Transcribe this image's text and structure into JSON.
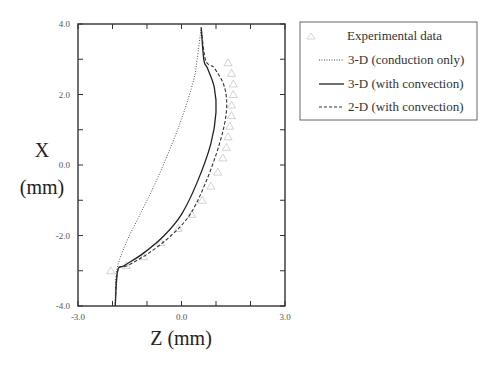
{
  "chart_data": {
    "type": "line",
    "title": "",
    "xlabel": "Z (mm)",
    "ylabel_line1": "X",
    "ylabel_line2": "(mm)",
    "xlim": [
      -3.0,
      3.0
    ],
    "ylim": [
      -4.0,
      4.0
    ],
    "x_tick_labels": [
      "-3.0",
      "0.0",
      "3.0"
    ],
    "y_tick_labels": [
      "4.0",
      "2.0",
      "0.0",
      "-2.0",
      "-4.0"
    ],
    "grid": false,
    "legend_position": "upper-right-outside",
    "series": [
      {
        "name": "Experimental data",
        "style": "triangle-markers",
        "points": [
          [
            1.35,
            2.9
          ],
          [
            1.45,
            2.6
          ],
          [
            1.5,
            2.3
          ],
          [
            1.5,
            2.0
          ],
          [
            1.45,
            1.7
          ],
          [
            1.45,
            1.4
          ],
          [
            1.4,
            1.1
          ],
          [
            1.35,
            0.8
          ],
          [
            1.3,
            0.5
          ],
          [
            1.2,
            0.2
          ],
          [
            1.05,
            -0.2
          ],
          [
            0.85,
            -0.6
          ],
          [
            0.6,
            -1.0
          ],
          [
            0.3,
            -1.4
          ],
          [
            -0.1,
            -1.8
          ],
          [
            -0.6,
            -2.2
          ],
          [
            -1.1,
            -2.6
          ],
          [
            -1.6,
            -2.85
          ],
          [
            -2.05,
            -3.0
          ]
        ]
      },
      {
        "name": "3-D (conduction only)",
        "style": "dotted",
        "points": [
          [
            -1.92,
            -4.0
          ],
          [
            -1.88,
            -3.0
          ],
          [
            -1.6,
            -2.2
          ],
          [
            -1.2,
            -1.4
          ],
          [
            -0.8,
            -0.6
          ],
          [
            -0.4,
            0.3
          ],
          [
            0.0,
            1.3
          ],
          [
            0.35,
            2.4
          ],
          [
            0.45,
            2.97
          ],
          [
            0.57,
            3.9
          ]
        ]
      },
      {
        "name": "3-D (with convection)",
        "style": "solid",
        "points": [
          [
            -1.92,
            -4.0
          ],
          [
            -1.85,
            -3.0
          ],
          [
            -1.65,
            -2.85
          ],
          [
            -1.1,
            -2.5
          ],
          [
            -0.5,
            -2.0
          ],
          [
            0.0,
            -1.4
          ],
          [
            0.45,
            -0.5
          ],
          [
            0.85,
            0.6
          ],
          [
            1.0,
            1.5
          ],
          [
            0.95,
            2.2
          ],
          [
            0.75,
            2.75
          ],
          [
            0.65,
            2.97
          ],
          [
            0.57,
            3.9
          ]
        ]
      },
      {
        "name": "2-D (with convection)",
        "style": "dashed",
        "points": [
          [
            -1.92,
            -4.0
          ],
          [
            -1.85,
            -3.0
          ],
          [
            -1.55,
            -2.85
          ],
          [
            -0.95,
            -2.5
          ],
          [
            -0.3,
            -2.0
          ],
          [
            0.25,
            -1.4
          ],
          [
            0.7,
            -0.5
          ],
          [
            1.1,
            0.6
          ],
          [
            1.3,
            1.5
          ],
          [
            1.25,
            2.2
          ],
          [
            0.95,
            2.75
          ],
          [
            0.7,
            2.97
          ],
          [
            0.57,
            3.9
          ]
        ]
      }
    ]
  },
  "legend": {
    "items": [
      {
        "label": "Experimental data"
      },
      {
        "label": "3-D (conduction only)"
      },
      {
        "label": "3-D (with convection)"
      },
      {
        "label": "2-D (with convection)"
      }
    ]
  }
}
